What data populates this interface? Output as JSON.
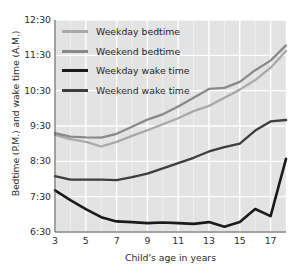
{
  "chart_data": {
    "type": "line",
    "title": "",
    "xlabel": "Child's age in years",
    "ylabel": "Bedtime (P.M.) and wake time (A.M.)",
    "xlim": [
      3,
      18
    ],
    "ylim_hours": [
      6.5,
      12.5
    ],
    "ytick_labels": [
      "12:30",
      "11:30",
      "10:30",
      "9:30",
      "8:30",
      "7:30",
      "6:30"
    ],
    "ytick_values": [
      12.5,
      11.5,
      10.5,
      9.5,
      8.5,
      7.5,
      6.5
    ],
    "xtick_labels": [
      "3",
      "5",
      "7",
      "9",
      "11",
      "13",
      "15",
      "17"
    ],
    "xtick_values": [
      3,
      5,
      7,
      9,
      11,
      13,
      15,
      17
    ],
    "grid": true,
    "legend_position": "upper left",
    "x": [
      3,
      4,
      5,
      6,
      7,
      8,
      9,
      10,
      11,
      12,
      13,
      14,
      15,
      16,
      17,
      18
    ],
    "series": [
      {
        "name": "Weekday bedtime",
        "color": "#a9a9a9",
        "values": [
          9.25,
          9.13,
          9.05,
          8.92,
          9.05,
          9.22,
          9.38,
          9.55,
          9.72,
          9.92,
          10.07,
          10.3,
          10.53,
          10.8,
          11.15,
          11.62
        ]
      },
      {
        "name": "Weekend bedtime",
        "color": "#8a8a8a",
        "values": [
          9.3,
          9.2,
          9.18,
          9.17,
          9.28,
          9.48,
          9.68,
          9.83,
          10.05,
          10.3,
          10.55,
          10.58,
          10.75,
          11.08,
          11.35,
          11.78
        ]
      },
      {
        "name": "Weekday wake time",
        "color": "#1a1a1a",
        "values": [
          7.68,
          7.4,
          7.15,
          6.92,
          6.8,
          6.78,
          6.75,
          6.77,
          6.75,
          6.73,
          6.78,
          6.65,
          6.78,
          7.15,
          6.95,
          8.57
        ]
      },
      {
        "name": "Weekend wake time",
        "color": "#3d3d3d",
        "values": [
          8.08,
          7.98,
          7.98,
          7.98,
          7.97,
          8.05,
          8.15,
          8.3,
          8.45,
          8.6,
          8.78,
          8.9,
          9.0,
          9.37,
          9.63,
          9.67
        ]
      }
    ]
  },
  "legend": {
    "items": [
      {
        "label": "Weekday bedtime"
      },
      {
        "label": "Weekend bedtime"
      },
      {
        "label": "Weekday wake time"
      },
      {
        "label": "Weekend wake time"
      }
    ]
  },
  "style": {
    "plot_background": "#e3e3e3",
    "gridline_color": "#ffffff",
    "axis_text_color": "#2b2b2b"
  }
}
